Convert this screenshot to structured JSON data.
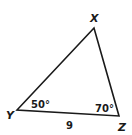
{
  "diagram": {
    "type": "triangle",
    "stroke_color": "#1a1a1a",
    "vertices": [
      {
        "id": "X",
        "label": "X",
        "x": 94,
        "y": 28
      },
      {
        "id": "Y",
        "label": "Y",
        "x": 17,
        "y": 110
      },
      {
        "id": "Z",
        "label": "Z",
        "x": 119,
        "y": 116
      }
    ],
    "angles": [
      {
        "vertex": "Y",
        "label": "50°"
      },
      {
        "vertex": "Z",
        "label": "70°"
      }
    ],
    "sides": [
      {
        "between": [
          "Y",
          "Z"
        ],
        "label": "9"
      }
    ]
  }
}
